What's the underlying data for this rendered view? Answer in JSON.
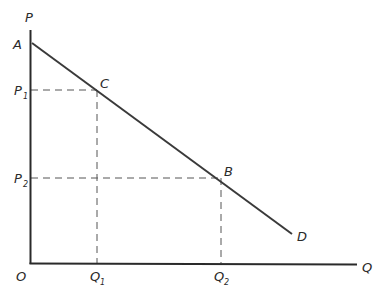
{
  "diagram": {
    "type": "demand-curve",
    "colors": {
      "axis": "#2a2a2a",
      "curve": "#3a3a3a",
      "guide": "#555555"
    },
    "axes": {
      "y_label": "P",
      "x_label": "Q",
      "origin_label": "O"
    },
    "curve": {
      "start_label": "A",
      "end_label": "D"
    },
    "points": [
      {
        "label": "C",
        "price_label": "P",
        "price_sub": "1",
        "qty_label": "Q",
        "qty_sub": "1"
      },
      {
        "label": "B",
        "price_label": "P",
        "price_sub": "2",
        "qty_label": "Q",
        "qty_sub": "2"
      }
    ]
  }
}
